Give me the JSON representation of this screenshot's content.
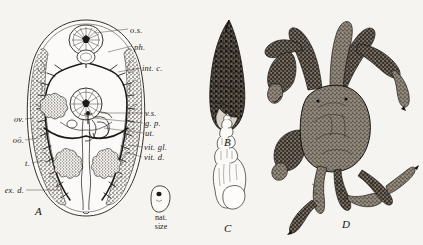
{
  "plate": {
    "description": "Engraved natural-history plate: lung fluke anatomy, two snail shells and a crab",
    "background_color": "#f6f4f1",
    "ink_color": "#1d1a17"
  },
  "figures": [
    {
      "key": "A",
      "caption": "A",
      "name": "fluke-anatomy-diagram",
      "type": "labelled-anatomical-diagram"
    },
    {
      "key": "B",
      "caption": "B",
      "name": "snail-shell-photograph",
      "type": "halftone-shell"
    },
    {
      "key": "C",
      "caption": "C",
      "name": "snail-shell-line-drawing",
      "type": "outline-shell"
    },
    {
      "key": "D",
      "caption": "D",
      "name": "crab-engraving",
      "type": "halftone-crab"
    }
  ],
  "figure_a": {
    "caption": "A",
    "natural_size": {
      "line1": "nat.",
      "line2": "size"
    },
    "labels_right": [
      {
        "text": "o.s.",
        "meaning": "oral-sucker"
      },
      {
        "text": "ph.",
        "meaning": "pharynx"
      },
      {
        "text": "int. c.",
        "meaning": "intestinal-caecum"
      },
      {
        "text": "v.s.",
        "meaning": "ventral-sucker"
      },
      {
        "text": "g. p.",
        "meaning": "genital-pore"
      },
      {
        "text": "ut.",
        "meaning": "uterus"
      },
      {
        "text": "vit. gl.",
        "meaning": "vitelline-gland"
      },
      {
        "text": "vit. d.",
        "meaning": "vitelline-duct"
      }
    ],
    "labels_left": [
      {
        "text": "ov.",
        "meaning": "ovary"
      },
      {
        "text": "oö.",
        "meaning": "ootype"
      },
      {
        "text": "t.",
        "meaning": "testis"
      },
      {
        "text": "ex. d.",
        "meaning": "excretory-duct"
      }
    ]
  }
}
